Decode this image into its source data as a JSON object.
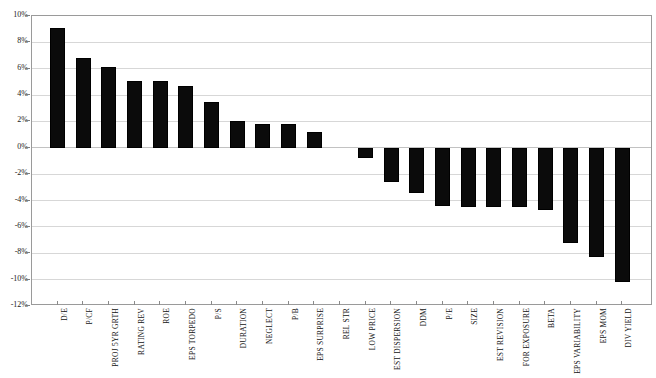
{
  "chart_data": {
    "type": "bar",
    "title": "",
    "xlabel": "",
    "ylabel": "",
    "ylim": [
      -12,
      10
    ],
    "ytick_labels": [
      "10%",
      "8%",
      "6%",
      "4%",
      "2%",
      "0%",
      "-2%",
      "-4%",
      "-6%",
      "-8%",
      "-10%",
      "-12%"
    ],
    "ytick_values": [
      10,
      8,
      6,
      4,
      2,
      0,
      -2,
      -4,
      -6,
      -8,
      -10,
      -12
    ],
    "grid": true,
    "legend": "none",
    "bar_color": "#000000",
    "background_color": "#ffffff",
    "gridline_color": "#d7d7d7",
    "axis_color": "#9a9a9a",
    "categories": [
      "D/E",
      "P/CF",
      "PROJ 5YR GRTH",
      "RATING REV",
      "ROE",
      "EPS TORPEDO",
      "P/S",
      "DURATION",
      "NEGLECT",
      "P/B",
      "EPS SURPRISE",
      "REL STR",
      "LOW PRICE",
      "EST DISPERSION",
      "DDM",
      "P/E",
      "SIZE",
      "EST REVISION",
      "FOR EXPOSURE",
      "BETA",
      "EPS VARIABILITY",
      "EPS MOM",
      "DIV YIELD"
    ],
    "values": [
      9.1,
      6.8,
      6.1,
      5.1,
      5.1,
      4.7,
      3.5,
      2.0,
      1.8,
      1.8,
      1.2,
      0.0,
      -0.8,
      -2.6,
      -3.4,
      -4.4,
      -4.5,
      -4.5,
      -4.5,
      -4.7,
      -7.2,
      -8.3,
      -10.2
    ]
  }
}
